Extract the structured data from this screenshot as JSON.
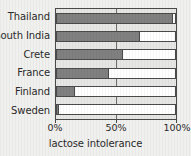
{
  "chart_data": {
    "type": "bar",
    "orientation": "horizontal",
    "title": "",
    "xlabel": "lactose intolerance",
    "ylabel": "",
    "categories": [
      "Thailand",
      "South India",
      "Crete",
      "France",
      "Finland",
      "Sweden"
    ],
    "values": [
      98,
      70,
      56,
      44,
      15,
      2
    ],
    "xlim": [
      0,
      100
    ],
    "xticks": [
      0,
      50,
      100
    ],
    "xtick_labels": [
      "0%",
      "50%",
      "100%"
    ],
    "grid": true,
    "gridlines_at": [
      50
    ],
    "legend": null,
    "bar_color": "#808080",
    "bar_unfilled_color": "#ffffff",
    "plot_background": "#e6e6e4",
    "figure_background": "#f0f0ee",
    "axis_color": "#4a4a4a",
    "text_color": "#2b2b2b"
  }
}
